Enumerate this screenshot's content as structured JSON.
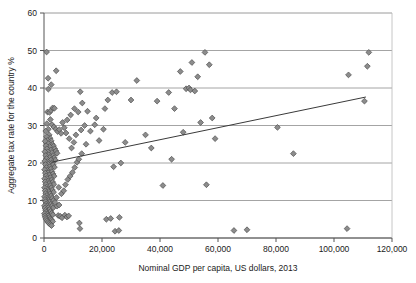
{
  "chart_data": {
    "type": "scatter",
    "title": "",
    "xlabel": "Nominal GDP per capita, US dollars, 2013",
    "ylabel": "Aggregate tax rate for the country %",
    "xlim": [
      0,
      120000
    ],
    "ylim": [
      0,
      60
    ],
    "xticks": [
      0,
      20000,
      40000,
      60000,
      80000,
      100000,
      120000
    ],
    "xtick_labels": [
      "0",
      "20,000",
      "40,000",
      "60,000",
      "80,000",
      "100,000",
      "120,000"
    ],
    "yticks": [
      0,
      10,
      20,
      30,
      40,
      50,
      60
    ],
    "ytick_labels": [
      "0",
      "10",
      "20",
      "30",
      "40",
      "50",
      "60"
    ],
    "grid": "horizontal",
    "legend": "none",
    "marker": "diamond",
    "marker_color": "#8c8c8c",
    "marker_edge_color": "#4d4d4d",
    "gridline_color": "#9a9a9a",
    "axis_color": "#555555",
    "trendline_color": "#3a3a3a",
    "trendline": {
      "x": [
        2500,
        111000
      ],
      "y": [
        20.2,
        37.6
      ]
    },
    "points": [
      [
        900,
        49.6
      ],
      [
        1400,
        42.6
      ],
      [
        1500,
        39.7
      ],
      [
        2500,
        40.9
      ],
      [
        4200,
        44.6
      ],
      [
        1200,
        33.6
      ],
      [
        1900,
        33.5
      ],
      [
        2400,
        34.0
      ],
      [
        3000,
        34.7
      ],
      [
        3600,
        34.6
      ],
      [
        2200,
        31.6
      ],
      [
        2800,
        30.2
      ],
      [
        3400,
        29.6
      ],
      [
        4100,
        29.0
      ],
      [
        4700,
        28.4
      ],
      [
        5300,
        28.9
      ],
      [
        5900,
        27.9
      ],
      [
        6400,
        30.8
      ],
      [
        7000,
        29.4
      ],
      [
        7600,
        28.0
      ],
      [
        1000,
        30.5
      ],
      [
        1500,
        29.0
      ],
      [
        1800,
        27.5
      ],
      [
        2100,
        26.6
      ],
      [
        2500,
        25.9
      ],
      [
        2900,
        25.0
      ],
      [
        3300,
        24.5
      ],
      [
        3700,
        23.8
      ],
      [
        4100,
        23.2
      ],
      [
        4500,
        22.6
      ],
      [
        600,
        28.5
      ],
      [
        900,
        27.0
      ],
      [
        1200,
        26.0
      ],
      [
        1500,
        25.2
      ],
      [
        1900,
        24.4
      ],
      [
        2300,
        23.5
      ],
      [
        2700,
        22.8
      ],
      [
        3100,
        22.0
      ],
      [
        3500,
        21.4
      ],
      [
        3900,
        20.8
      ],
      [
        400,
        25.8
      ],
      [
        700,
        24.6
      ],
      [
        1000,
        23.8
      ],
      [
        1300,
        23.0
      ],
      [
        1600,
        22.2
      ],
      [
        2000,
        21.5
      ],
      [
        2400,
        20.8
      ],
      [
        2800,
        20.1
      ],
      [
        3200,
        19.5
      ],
      [
        3600,
        18.9
      ],
      [
        300,
        23.0
      ],
      [
        600,
        22.0
      ],
      [
        900,
        21.2
      ],
      [
        1200,
        20.4
      ],
      [
        1500,
        19.7
      ],
      [
        1900,
        19.0
      ],
      [
        2300,
        18.4
      ],
      [
        2700,
        17.7
      ],
      [
        3100,
        17.1
      ],
      [
        3500,
        16.5
      ],
      [
        250,
        20.5
      ],
      [
        500,
        19.6
      ],
      [
        800,
        18.8
      ],
      [
        1100,
        18.1
      ],
      [
        1400,
        17.4
      ],
      [
        1800,
        16.8
      ],
      [
        2200,
        16.1
      ],
      [
        2600,
        15.5
      ],
      [
        3000,
        14.9
      ],
      [
        3400,
        14.3
      ],
      [
        200,
        18.2
      ],
      [
        450,
        17.3
      ],
      [
        700,
        16.6
      ],
      [
        1000,
        15.9
      ],
      [
        1300,
        15.2
      ],
      [
        1700,
        14.6
      ],
      [
        2100,
        14.0
      ],
      [
        2500,
        13.4
      ],
      [
        2900,
        12.8
      ],
      [
        3300,
        12.2
      ],
      [
        200,
        15.8
      ],
      [
        400,
        15.0
      ],
      [
        650,
        14.3
      ],
      [
        900,
        13.6
      ],
      [
        1200,
        13.0
      ],
      [
        1600,
        12.4
      ],
      [
        2000,
        11.8
      ],
      [
        2400,
        11.2
      ],
      [
        2800,
        10.6
      ],
      [
        3200,
        10.0
      ],
      [
        180,
        13.4
      ],
      [
        380,
        12.6
      ],
      [
        600,
        11.9
      ],
      [
        850,
        11.3
      ],
      [
        1150,
        10.7
      ],
      [
        1500,
        10.1
      ],
      [
        1900,
        9.6
      ],
      [
        2300,
        9.0
      ],
      [
        2700,
        8.5
      ],
      [
        3100,
        8.0
      ],
      [
        160,
        11.0
      ],
      [
        350,
        10.3
      ],
      [
        560,
        9.7
      ],
      [
        800,
        9.1
      ],
      [
        1100,
        8.6
      ],
      [
        1450,
        8.1
      ],
      [
        1850,
        7.6
      ],
      [
        2250,
        7.1
      ],
      [
        2650,
        6.6
      ],
      [
        3050,
        6.2
      ],
      [
        150,
        8.6
      ],
      [
        320,
        8.0
      ],
      [
        520,
        7.4
      ],
      [
        760,
        6.9
      ],
      [
        1050,
        6.4
      ],
      [
        1400,
        5.9
      ],
      [
        1800,
        5.5
      ],
      [
        2200,
        5.1
      ],
      [
        2600,
        4.8
      ],
      [
        3000,
        4.4
      ],
      [
        140,
        6.5
      ],
      [
        300,
        5.9
      ],
      [
        500,
        5.4
      ],
      [
        740,
        5.0
      ],
      [
        1020,
        4.6
      ],
      [
        1380,
        4.2
      ],
      [
        1780,
        3.9
      ],
      [
        2180,
        3.6
      ],
      [
        2580,
        3.3
      ],
      [
        4900,
        6.0
      ],
      [
        5600,
        5.8
      ],
      [
        6200,
        5.4
      ],
      [
        7200,
        6.1
      ],
      [
        7900,
        5.6
      ],
      [
        8500,
        5.9
      ],
      [
        12200,
        4.0
      ],
      [
        4500,
        8.5
      ],
      [
        5200,
        8.8
      ],
      [
        3800,
        9.5
      ],
      [
        4300,
        10.8
      ],
      [
        6000,
        11.8
      ],
      [
        6800,
        12.6
      ],
      [
        5100,
        13.5
      ],
      [
        7400,
        14.2
      ],
      [
        8200,
        15.6
      ],
      [
        9000,
        16.5
      ],
      [
        9800,
        17.5
      ],
      [
        10600,
        18.8
      ],
      [
        11400,
        20.2
      ],
      [
        12000,
        21.0
      ],
      [
        13000,
        22.5
      ],
      [
        9500,
        24.0
      ],
      [
        10300,
        25.5
      ],
      [
        8700,
        26.5
      ],
      [
        11000,
        27.5
      ],
      [
        12800,
        28.8
      ],
      [
        8000,
        31.5
      ],
      [
        9200,
        32.8
      ],
      [
        10500,
        34.5
      ],
      [
        11800,
        33.6
      ],
      [
        13200,
        36.0
      ],
      [
        14000,
        30.0
      ],
      [
        15000,
        33.8
      ],
      [
        12500,
        39.0
      ],
      [
        16000,
        28.5
      ],
      [
        17500,
        30.2
      ],
      [
        19000,
        26.0
      ],
      [
        14500,
        25.0
      ],
      [
        20500,
        29.0
      ],
      [
        22000,
        36.8
      ],
      [
        23500,
        38.8
      ],
      [
        25000,
        39.0
      ],
      [
        21000,
        34.5
      ],
      [
        18000,
        32.0
      ],
      [
        26500,
        20.0
      ],
      [
        24000,
        19.0
      ],
      [
        21500,
        5.0
      ],
      [
        23000,
        5.2
      ],
      [
        24500,
        1.8
      ],
      [
        25800,
        2.0
      ],
      [
        26000,
        5.5
      ],
      [
        12400,
        2.5
      ],
      [
        28000,
        25.5
      ],
      [
        30000,
        36.8
      ],
      [
        32000,
        42.0
      ],
      [
        35000,
        27.5
      ],
      [
        37000,
        24.0
      ],
      [
        39000,
        36.5
      ],
      [
        41000,
        14.0
      ],
      [
        43000,
        38.8
      ],
      [
        45000,
        34.5
      ],
      [
        47000,
        44.4
      ],
      [
        49000,
        39.8
      ],
      [
        50000,
        40.0
      ],
      [
        50500,
        39.5
      ],
      [
        51000,
        46.8
      ],
      [
        52000,
        39.2
      ],
      [
        53000,
        43.0
      ],
      [
        54000,
        30.8
      ],
      [
        55500,
        49.5
      ],
      [
        57000,
        46.2
      ],
      [
        58000,
        32.0
      ],
      [
        59000,
        26.5
      ],
      [
        56000,
        14.2
      ],
      [
        48000,
        28.2
      ],
      [
        44000,
        21.0
      ],
      [
        65500,
        2.0
      ],
      [
        70000,
        2.2
      ],
      [
        80500,
        29.5
      ],
      [
        86000,
        22.5
      ],
      [
        104500,
        2.5
      ],
      [
        105000,
        43.5
      ],
      [
        110500,
        36.5
      ],
      [
        111500,
        45.8
      ],
      [
        112000,
        49.5
      ]
    ]
  }
}
